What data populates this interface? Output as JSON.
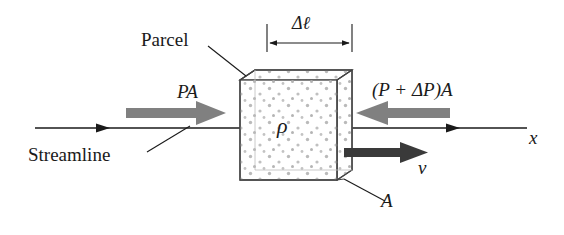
{
  "figure": {
    "labels": {
      "parcel": "Parcel",
      "streamline": "Streamline",
      "pressure_force_left": "PA",
      "pressure_force_right": "(P + ΔP)A",
      "length": "Δℓ",
      "density": "ρ",
      "velocity": "v",
      "axis": "x",
      "area": "A"
    },
    "colors": {
      "ink": "#1a1a1a",
      "outline": "#444444",
      "pressure_arrow": "#808080",
      "velocity_arrow": "#3a3a3a",
      "dots": "#b4b4b4",
      "hidden_edge": "#aaaaaa",
      "background": "#ffffff"
    },
    "geometry": {
      "cube_front": {
        "x": 240,
        "y": 80,
        "w": 97,
        "h": 100
      },
      "cube_depth": {
        "dx": 15,
        "dy": -10
      },
      "streamline_y": 128,
      "streamline_x_start": 35,
      "streamline_x_end": 525
    }
  }
}
